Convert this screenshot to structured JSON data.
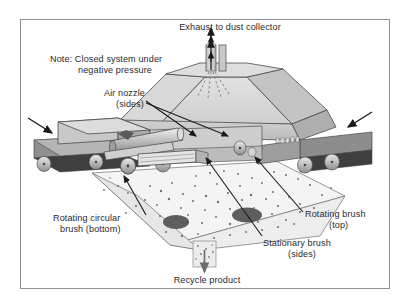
{
  "diagram": {
    "title_context": "Closed-system conveyor brush cleaning station with dust collection",
    "frame_border_color": "#8e8e93",
    "labels": {
      "exhaust": "Exhaust to dust collector",
      "note_line1": "Note: Closed system under",
      "note_line2": "negative pressure",
      "air_nozzle_line1": "Air nozzle",
      "air_nozzle_line2": "(sides)",
      "rotating_circular_line1": "Rotating circular",
      "rotating_circular_line2": "brush (bottom)",
      "rotating_top_line1": "Rotating brush",
      "rotating_top_line2": "(top)",
      "stationary_line1": "Stationary brush",
      "stationary_line2": "(sides)",
      "recycle": "Recycle product"
    },
    "colors": {
      "text": "#2b2b2b",
      "outline": "#4a4a4a",
      "hood_top": "#d8d8d8",
      "hood_front": "#c6c6c6",
      "hood_side": "#b0b0b0",
      "hopper": "#efefef",
      "belt_dark": "#3a3a3a",
      "belt_mid": "#9a9a9a",
      "roller": "#bdbdbd",
      "particle": "#6f6f6f",
      "arrow": "#1a1a1a"
    },
    "components": [
      "exhaust-duct",
      "hood-canopy",
      "left-conveyor",
      "right-conveyor",
      "rotating-top-brush",
      "rotating-circular-bottom-brush",
      "stationary-side-brush",
      "air-nozzles",
      "collection-hopper",
      "recycle-chute"
    ]
  }
}
